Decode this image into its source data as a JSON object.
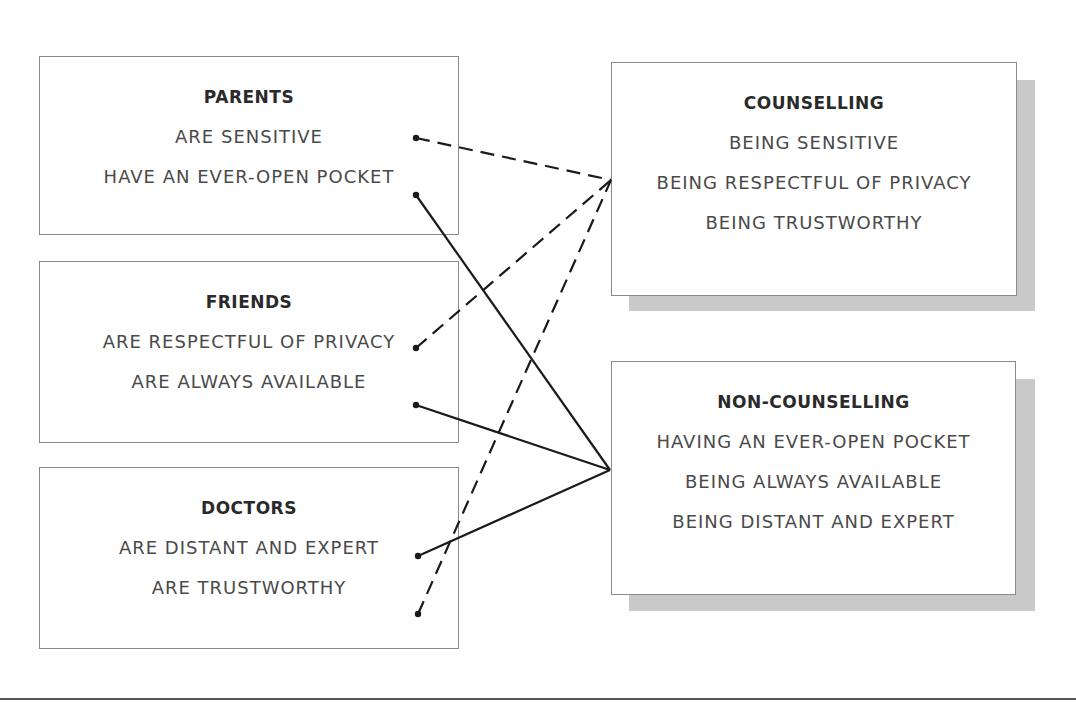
{
  "diagram": {
    "sources": [
      {
        "title": "PARENTS",
        "items": [
          "ARE SENSITIVE",
          "HAVE AN EVER-OPEN POCKET"
        ]
      },
      {
        "title": "FRIENDS",
        "items": [
          "ARE RESPECTFUL OF PRIVACY",
          "ARE ALWAYS AVAILABLE"
        ]
      },
      {
        "title": "DOCTORS",
        "items": [
          "ARE DISTANT AND EXPERT",
          "ARE TRUSTWORTHY"
        ]
      }
    ],
    "targets": [
      {
        "title": "COUNSELLING",
        "items": [
          "BEING SENSITIVE",
          "BEING RESPECTFUL OF PRIVACY",
          "BEING TRUSTWORTHY"
        ]
      },
      {
        "title": "NON-COUNSELLING",
        "items": [
          "HAVING AN EVER-OPEN POCKET",
          "BEING ALWAYS AVAILABLE",
          "BEING DISTANT AND EXPERT"
        ]
      }
    ],
    "connections": [
      {
        "from": "PARENTS: ARE SENSITIVE",
        "to": "COUNSELLING",
        "style": "dashed"
      },
      {
        "from": "PARENTS: HAVE AN EVER-OPEN POCKET",
        "to": "NON-COUNSELLING",
        "style": "solid"
      },
      {
        "from": "FRIENDS: ARE RESPECTFUL OF PRIVACY",
        "to": "COUNSELLING",
        "style": "dashed"
      },
      {
        "from": "FRIENDS: ARE ALWAYS AVAILABLE",
        "to": "NON-COUNSELLING",
        "style": "solid"
      },
      {
        "from": "DOCTORS: ARE DISTANT AND EXPERT",
        "to": "NON-COUNSELLING",
        "style": "solid"
      },
      {
        "from": "DOCTORS: ARE TRUSTWORTHY",
        "to": "COUNSELLING",
        "style": "dashed"
      }
    ]
  },
  "colors": {
    "line": "#1a1a1a",
    "border": "#8a8a8a",
    "shadow": "#c9c9c9"
  }
}
